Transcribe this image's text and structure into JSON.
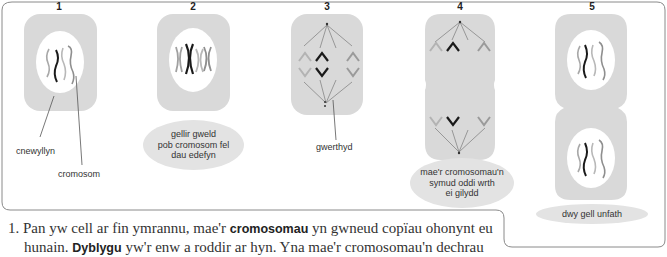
{
  "figure": {
    "stages": [
      {
        "number": "1",
        "labels": [
          "cnewyllyn",
          "cromosom"
        ]
      },
      {
        "number": "2",
        "caption": "gellir gweld\npob cromosom fel\ndau edefyn"
      },
      {
        "number": "3",
        "labels": [
          "gwerthyd"
        ]
      },
      {
        "number": "4",
        "caption": "mae'r cromosomau'n\nsymud oddi wrth\nei gilydd"
      },
      {
        "number": "5",
        "caption": "dwy gell unfath"
      }
    ],
    "colors": {
      "cell_fill": "#d9d9d9",
      "nucleus_fill": "#ffffff",
      "bubble_fill": "#e3e3e3",
      "chromosome_dark": "#1a1a1a",
      "chromosome_grey": "#8f8f8f",
      "chromosome_light": "#b3b3b3",
      "frame_stroke": "#8a8a8a"
    }
  },
  "body_text": {
    "line1": {
      "prefix": "1. Pan yw cell ar fin ymrannu, mae'r ",
      "bold": "cromosomau",
      "suffix": " yn gwneud copïau ohonynt eu"
    },
    "line2": {
      "prefix": "hunain. ",
      "bold": "Dyblygu",
      "suffix": " yw'r enw a roddir ar hyn. Yna mae'r cromosomau'n dechrau"
    }
  }
}
